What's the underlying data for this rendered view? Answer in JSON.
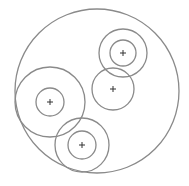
{
  "diagram": {
    "stroke_color": "#8a8a8a",
    "marker_color": "#333333",
    "marker_symbol": "+",
    "groups": [
      {
        "name": "top-right",
        "rings": 2
      },
      {
        "name": "middle-right",
        "rings": 1
      },
      {
        "name": "left",
        "rings": 2
      },
      {
        "name": "bottom",
        "rings": 2
      }
    ]
  }
}
